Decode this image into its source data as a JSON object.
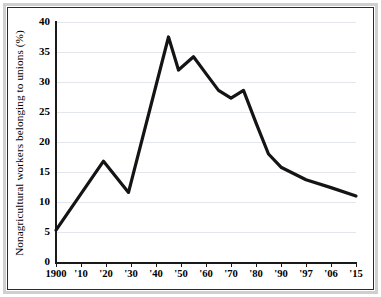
{
  "chart_data": {
    "type": "line",
    "title": "",
    "xlabel": "",
    "ylabel": "Nonagricultural workers belonging to unions (%)",
    "ylim": [
      0,
      40
    ],
    "yticks": [
      0,
      5,
      10,
      15,
      20,
      25,
      30,
      35,
      40
    ],
    "ytick_labels": [
      "0",
      "5",
      "10",
      "15",
      "20",
      "25",
      "30",
      "35",
      "40"
    ],
    "xtick_labels": [
      "1900",
      "'10",
      "'20",
      "'30",
      "'40",
      "'50",
      "'60",
      "'70",
      "'80",
      "'90",
      "'97",
      "'06",
      "'15"
    ],
    "xtick_years": [
      1900,
      1910,
      1920,
      1930,
      1940,
      1950,
      1960,
      1970,
      1980,
      1990,
      1997,
      2006,
      2015
    ],
    "grid": "horizontal",
    "legend": "none",
    "line_color": "#141414",
    "grid_color": "#e3e6ea",
    "axis_color": "#1a1a1a",
    "series": [
      {
        "name": "Union membership",
        "points": [
          {
            "x": 1900,
            "y": 5.3
          },
          {
            "x": 1919,
            "y": 16.8
          },
          {
            "x": 1929,
            "y": 11.6
          },
          {
            "x": 1945,
            "y": 37.5
          },
          {
            "x": 1949,
            "y": 32.0
          },
          {
            "x": 1955,
            "y": 34.2
          },
          {
            "x": 1960,
            "y": 31.4
          },
          {
            "x": 1965,
            "y": 28.6
          },
          {
            "x": 1970,
            "y": 27.3
          },
          {
            "x": 1975,
            "y": 28.6
          },
          {
            "x": 1980,
            "y": 23.2
          },
          {
            "x": 1985,
            "y": 18.0
          },
          {
            "x": 1990,
            "y": 15.8
          },
          {
            "x": 1997,
            "y": 13.7
          },
          {
            "x": 2006,
            "y": 12.4
          },
          {
            "x": 2015,
            "y": 11.0
          }
        ]
      }
    ]
  }
}
